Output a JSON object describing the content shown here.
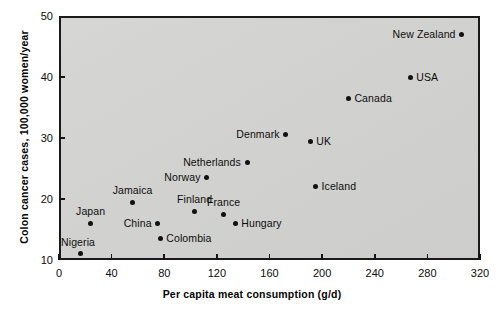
{
  "chart_data": {
    "type": "scatter",
    "title": "",
    "xlabel": "Per capita meat consumption (g/d)",
    "ylabel": "Colon cancer cases, 100,000 women/year",
    "xlim": [
      0,
      320
    ],
    "ylim": [
      10,
      50
    ],
    "xticks": [
      0,
      40,
      80,
      120,
      160,
      200,
      240,
      280,
      320
    ],
    "yticks": [
      10,
      20,
      30,
      40,
      50
    ],
    "xticklabels": [
      "0",
      "40",
      "80",
      "120",
      "160",
      "200",
      "240",
      "280",
      "320"
    ],
    "yticklabels": [
      "10",
      "20",
      "30",
      "40",
      "50"
    ],
    "grid": false,
    "legend": null,
    "plot_background": "#d3d3d1",
    "marker_color": "#111111",
    "points": [
      {
        "name": "Nigeria",
        "x": 16,
        "y": 11.0,
        "label_pos": "left-above"
      },
      {
        "name": "Japan",
        "x": 24,
        "y": 16.0,
        "label_pos": "above"
      },
      {
        "name": "Jamaica",
        "x": 56,
        "y": 19.5,
        "label_pos": "above"
      },
      {
        "name": "China",
        "x": 75,
        "y": 16.0,
        "label_pos": "left"
      },
      {
        "name": "Colombia",
        "x": 77,
        "y": 13.5,
        "label_pos": "right"
      },
      {
        "name": "Finland",
        "x": 103,
        "y": 18.0,
        "label_pos": "above"
      },
      {
        "name": "Norway",
        "x": 112,
        "y": 23.5,
        "label_pos": "left"
      },
      {
        "name": "France",
        "x": 125,
        "y": 17.5,
        "label_pos": "above"
      },
      {
        "name": "Hungary",
        "x": 134,
        "y": 16.0,
        "label_pos": "right"
      },
      {
        "name": "Netherlands",
        "x": 143,
        "y": 26.0,
        "label_pos": "left"
      },
      {
        "name": "Denmark",
        "x": 172,
        "y": 30.5,
        "label_pos": "left"
      },
      {
        "name": "UK",
        "x": 191,
        "y": 29.5,
        "label_pos": "right"
      },
      {
        "name": "Iceland",
        "x": 195,
        "y": 22.0,
        "label_pos": "right"
      },
      {
        "name": "Canada",
        "x": 220,
        "y": 36.5,
        "label_pos": "right"
      },
      {
        "name": "USA",
        "x": 267,
        "y": 40.0,
        "label_pos": "right"
      },
      {
        "name": "New Zealand",
        "x": 306,
        "y": 47.0,
        "label_pos": "left"
      }
    ]
  }
}
